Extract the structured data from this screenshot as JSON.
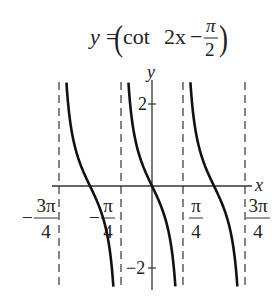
{
  "chart_data": {
    "type": "line",
    "title_parts": {
      "lhs": "y",
      "eq": "=",
      "fn": "cot",
      "arg_pre": "2x",
      "minus": "−",
      "frac_num": "π",
      "frac_den": "2"
    },
    "xlabel": "x",
    "ylabel": "y",
    "x_ticks": [
      {
        "value": -2.356,
        "label_num": "3π",
        "label_den": "4",
        "sign": "−"
      },
      {
        "value": -0.785,
        "label_num": "π",
        "label_den": "4",
        "sign": "−"
      },
      {
        "value": 0.785,
        "label_num": "π",
        "label_den": "4",
        "sign": ""
      },
      {
        "value": 2.356,
        "label_num": "3π",
        "label_den": "4",
        "sign": ""
      }
    ],
    "y_ticks": [
      {
        "value": 2,
        "label": "2"
      },
      {
        "value": -2,
        "label": "−2"
      }
    ],
    "asymptotes": [
      -2.356,
      -0.785,
      0.785,
      2.356
    ],
    "asymptote_style": "dashed",
    "xlim": [
      -2.55,
      2.65
    ],
    "ylim": [
      -2.5,
      2.55
    ],
    "grid": false,
    "series": [
      {
        "name": "y = cot(2x − π/2)",
        "branch_x": [
          -2.356,
          -0.785
        ],
        "zero_at": -1.571
      },
      {
        "name": "y = cot(2x − π/2)",
        "branch_x": [
          -0.785,
          0.785
        ],
        "zero_at": 0
      },
      {
        "name": "y = cot(2x − π/2)",
        "branch_x": [
          0.785,
          2.356
        ],
        "zero_at": 1.571
      }
    ],
    "sample_points": {
      "x": [
        -1.2,
        -0.6,
        -0.3,
        0,
        0.3,
        0.6,
        1.2
      ],
      "y": [
        -0.27,
        2.47,
        0.68,
        0,
        -0.68,
        -2.47,
        0.27
      ]
    }
  }
}
